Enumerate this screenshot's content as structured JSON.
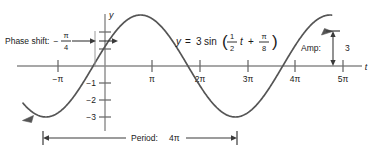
{
  "chart_data": {
    "type": "line",
    "title": "",
    "equation_text": "y = 3 sin( 1/2 t + π/8 )",
    "function": {
      "amplitude": 3,
      "angular_frequency": 0.5,
      "phase": 0.39269908169872414,
      "vertical_shift": 0
    },
    "xlabel": "t",
    "ylabel": "y",
    "x_unit_label": "π",
    "xlim": [
      -1.35,
      5.5
    ],
    "ylim": [
      -3.8,
      3.6
    ],
    "grid": false,
    "legend": null,
    "x_ticks": [
      {
        "value": -1,
        "label": "−π"
      },
      {
        "value": 1,
        "label": "π"
      },
      {
        "value": 2,
        "label": "2π"
      },
      {
        "value": 3,
        "label": "3π"
      },
      {
        "value": 4,
        "label": "4π"
      },
      {
        "value": 5,
        "label": "5π"
      }
    ],
    "y_ticks": [
      {
        "value": -1,
        "label": "−1"
      },
      {
        "value": -2,
        "label": "−2"
      },
      {
        "value": -3,
        "label": "−3"
      }
    ],
    "y_unlabeled_ticks": [
      1,
      2,
      3
    ],
    "curve_endpoints": {
      "left_arrow": true,
      "right_arrow": true
    },
    "annotations": {
      "phase_shift": {
        "label": "Phase shift:",
        "value_sign": "−",
        "value_numerator": "π",
        "value_denominator": "4",
        "value": -0.7853981633974483
      },
      "amplitude": {
        "label": "Amp:",
        "value": "3"
      },
      "period": {
        "label": "Period:",
        "value": "4π",
        "span_start_x": -1,
        "span_end_x": 3
      }
    },
    "equation_parts": {
      "y": "y",
      "equals": "=",
      "coefficient": "3",
      "func": "sin",
      "open_paren": "(",
      "frac1_num": "1",
      "frac1_den": "2",
      "t": "t",
      "plus": "+",
      "frac2_num": "π",
      "frac2_den": "8",
      "close_paren": ")"
    }
  },
  "colors": {
    "axis": "#8a8a8a",
    "curve": "#555555",
    "text": "#1a1a1a",
    "annotation_line": "#4a4a4a",
    "background": "#ffffff"
  }
}
